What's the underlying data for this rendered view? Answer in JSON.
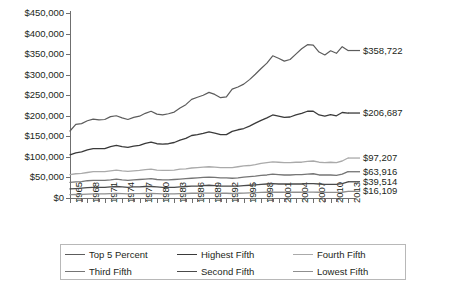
{
  "chart_data": {
    "type": "line",
    "title": "",
    "xlabel": "",
    "ylabel": "",
    "ylim": [
      0,
      450000
    ],
    "xlim": [
      1965,
      2013
    ],
    "grid": false,
    "legend_position": "bottom",
    "y_ticks": [
      "$0",
      "$50,000",
      "$100,000",
      "$150,000",
      "$200,000",
      "$250,000",
      "$300,000",
      "$350,000",
      "$400,000",
      "$450,000"
    ],
    "y_tick_values": [
      0,
      50000,
      100000,
      150000,
      200000,
      250000,
      300000,
      350000,
      400000,
      450000
    ],
    "x_tick_labels": [
      "1965",
      "1968",
      "1971",
      "1974",
      "1977",
      "1980",
      "1983",
      "1986",
      "1989",
      "1992",
      "1995",
      "1998",
      "2001",
      "2004",
      "2007",
      "2010",
      "2013"
    ],
    "x": [
      1965,
      1966,
      1967,
      1968,
      1969,
      1970,
      1971,
      1972,
      1973,
      1974,
      1975,
      1976,
      1977,
      1978,
      1979,
      1980,
      1981,
      1982,
      1983,
      1984,
      1985,
      1986,
      1987,
      1988,
      1989,
      1990,
      1991,
      1992,
      1993,
      1994,
      1995,
      1996,
      1997,
      1998,
      1999,
      2000,
      2001,
      2002,
      2003,
      2004,
      2005,
      2006,
      2007,
      2008,
      2009,
      2010,
      2011,
      2012,
      2013
    ],
    "series": [
      {
        "name": "Top 5 Percent",
        "color": "#5c5c5c",
        "width": 1.2,
        "end_label": "$358,722",
        "end_value": 358722,
        "values": [
          163000,
          179000,
          181000,
          188000,
          192000,
          190000,
          191000,
          198000,
          200000,
          195000,
          191000,
          196000,
          199000,
          206000,
          211000,
          204000,
          202000,
          205000,
          209000,
          219000,
          227000,
          240000,
          245000,
          250000,
          257000,
          252000,
          244000,
          246000,
          265000,
          270000,
          277000,
          288000,
          301000,
          315000,
          328000,
          346000,
          340000,
          333000,
          337000,
          350000,
          363000,
          373000,
          372000,
          355000,
          348000,
          358000,
          352000,
          368000,
          358722
        ]
      },
      {
        "name": "Highest Fifth",
        "color": "#3a3a3a",
        "width": 1.3,
        "end_label": "$206,687",
        "end_value": 206687,
        "values": [
          105000,
          110000,
          112000,
          117000,
          120000,
          120000,
          120000,
          125000,
          128000,
          125000,
          123000,
          126000,
          128000,
          133000,
          136000,
          132000,
          131000,
          132000,
          135000,
          141000,
          145000,
          152000,
          154000,
          157000,
          161000,
          158000,
          154000,
          154000,
          162000,
          166000,
          169000,
          175000,
          182000,
          189000,
          195000,
          202000,
          199000,
          196000,
          197000,
          202000,
          206000,
          211000,
          211000,
          202000,
          199000,
          203000,
          200000,
          208000,
          206687
        ]
      },
      {
        "name": "Fourth Fifth",
        "color": "#aaaaaa",
        "width": 1.3,
        "end_label": "$97,207",
        "end_value": 97207,
        "values": [
          57000,
          59000,
          60000,
          62000,
          64000,
          64000,
          64000,
          66000,
          68000,
          66000,
          65000,
          66000,
          67000,
          69000,
          70000,
          68000,
          67000,
          67000,
          68000,
          70000,
          71000,
          73000,
          74000,
          75000,
          76000,
          75000,
          74000,
          74000,
          74000,
          76000,
          78000,
          79000,
          81000,
          84000,
          86000,
          88000,
          87000,
          86000,
          86000,
          87000,
          87000,
          89000,
          90000,
          87000,
          86000,
          87000,
          86000,
          90000,
          97207
        ]
      },
      {
        "name": "Third Fifth",
        "color": "#757575",
        "width": 1.3,
        "end_label": "$63,916",
        "end_value": 63916,
        "values": [
          38000,
          39000,
          40000,
          42000,
          43000,
          43000,
          43000,
          44000,
          46000,
          44000,
          43000,
          44000,
          45000,
          46000,
          47000,
          45000,
          44000,
          44000,
          45000,
          46000,
          47000,
          48000,
          49000,
          50000,
          51000,
          50000,
          49000,
          49000,
          48000,
          49000,
          51000,
          52000,
          53000,
          55000,
          56000,
          58000,
          57000,
          56000,
          56000,
          57000,
          57000,
          58000,
          59000,
          56000,
          56000,
          56000,
          55000,
          58000,
          63916
        ]
      },
      {
        "name": "Second Fifth",
        "color": "#4a4a4a",
        "width": 1.3,
        "end_label": "$39,514",
        "end_value": 39514,
        "values": [
          22000,
          23000,
          24000,
          25000,
          26000,
          26000,
          26000,
          27000,
          28000,
          27000,
          26000,
          27000,
          27000,
          28000,
          28000,
          27000,
          26000,
          26000,
          26000,
          27000,
          28000,
          29000,
          29000,
          30000,
          31000,
          30000,
          29000,
          29000,
          29000,
          29000,
          30000,
          31000,
          32000,
          33000,
          34000,
          35000,
          34000,
          34000,
          34000,
          34000,
          34000,
          35000,
          35000,
          34000,
          33000,
          33000,
          33000,
          35000,
          39514
        ]
      },
      {
        "name": "Lowest Fifth",
        "color": "#8f8f8f",
        "width": 1.3,
        "end_label": "$16,109",
        "end_value": 16109,
        "values": [
          8000,
          8500,
          9000,
          9500,
          10000,
          10000,
          10000,
          10500,
          11000,
          10500,
          10000,
          10500,
          10500,
          11000,
          11000,
          10500,
          10000,
          10000,
          10000,
          10500,
          11000,
          11500,
          11500,
          12000,
          12000,
          12000,
          11500,
          11500,
          11000,
          11500,
          12000,
          12500,
          13000,
          13500,
          14000,
          14500,
          14000,
          14000,
          14000,
          14000,
          14000,
          14500,
          14500,
          14000,
          13500,
          13500,
          13500,
          14000,
          16109
        ]
      }
    ]
  },
  "legend": {
    "items": [
      {
        "label": "Top 5 Percent",
        "color": "#5c5c5c"
      },
      {
        "label": "Highest Fifth",
        "color": "#3a3a3a"
      },
      {
        "label": "Fourth Fifth",
        "color": "#aaaaaa"
      },
      {
        "label": "Third Fifth",
        "color": "#757575"
      },
      {
        "label": "Second Fifth",
        "color": "#4a4a4a"
      },
      {
        "label": "Lowest Fifth",
        "color": "#8f8f8f"
      }
    ]
  }
}
